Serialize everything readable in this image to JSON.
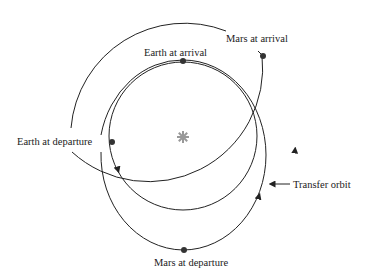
{
  "diagram": {
    "labels": {
      "mars_arrival": "Mars at arrival",
      "earth_arrival": "Earth at arrival",
      "earth_departure": "Earth at departure",
      "transfer_orbit": "Transfer orbit",
      "mars_departure": "Mars at departure"
    },
    "colors": {
      "line": "#222222",
      "sun": "#999999",
      "dot": "#333333"
    },
    "elements": {
      "sun": {
        "x": 183,
        "y": 137
      },
      "earth_orbit": {
        "cx": 183,
        "cy": 136,
        "r": 74
      },
      "mars_orbit": {
        "cx": 183,
        "cy": 137,
        "r": 114
      },
      "transfer_orbit": {
        "cx": 183,
        "cy": 155,
        "rx": 83,
        "ry": 95
      }
    }
  }
}
